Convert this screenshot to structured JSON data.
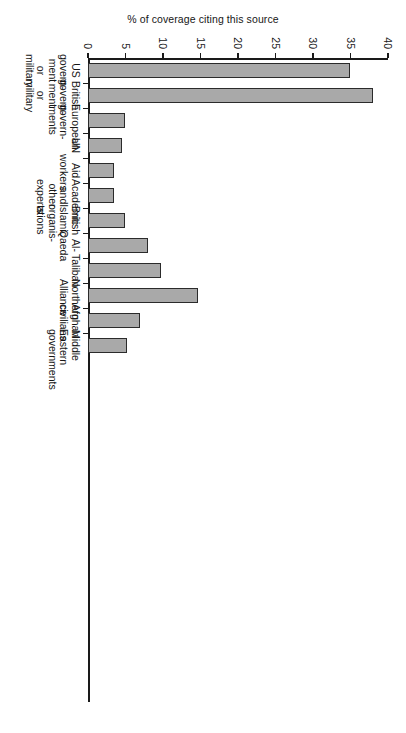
{
  "chart_data": {
    "type": "bar",
    "orientation": "vertical-rotated",
    "title": "",
    "xlabel": "",
    "ylabel": "% of coverage citing this source",
    "ylim": [
      0,
      40
    ],
    "yticks": [
      0,
      5,
      10,
      15,
      20,
      25,
      30,
      35,
      40
    ],
    "ytick_labels": [
      "0",
      "5",
      "10",
      "15",
      "20",
      "25",
      "30",
      "35",
      "40"
    ],
    "grid": false,
    "legend": false,
    "categories": [
      "US govern-\nment or\nmilitary",
      "British\ngovern-\nment or\nmilitary",
      "European\ngovern-\nments",
      "UN",
      "Aid\nworkers",
      "Academic\nand other\nexperts",
      "British\nIslamic\norganis-\nations",
      "Al-\nQaeda",
      "Taliban",
      "Northern\nAlliance",
      "Afghan\ncivilians",
      "Middle\nEastern\ngovernments"
    ],
    "values": [
      35,
      38,
      5,
      4.5,
      3.5,
      3.5,
      5,
      8,
      9.7,
      14.7,
      7,
      5.2
    ],
    "bar_color": "#a9a9a9",
    "bar_edge_color": "#2b2b2b",
    "axis_color": "#1a1a1a",
    "background": "#ffffff"
  }
}
